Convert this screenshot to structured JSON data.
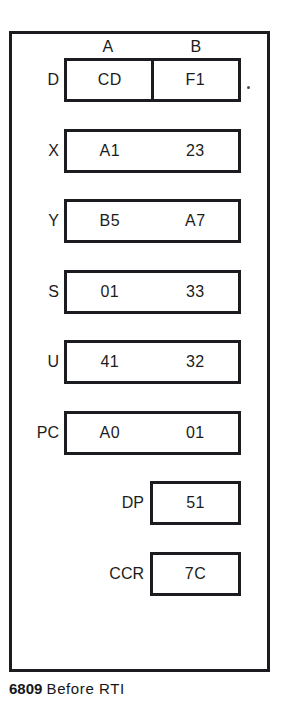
{
  "figure": {
    "column_headers": [
      "A",
      "B"
    ],
    "caption": {
      "code": "6809",
      "text": "Before RTI"
    },
    "registers": [
      {
        "label": "D",
        "width": "wide",
        "split": true,
        "values": [
          "CD",
          "F1"
        ]
      },
      {
        "label": "X",
        "width": "wide",
        "split": false,
        "values": [
          "A1",
          "23"
        ]
      },
      {
        "label": "Y",
        "width": "wide",
        "split": false,
        "values": [
          "B5",
          "A7"
        ]
      },
      {
        "label": "S",
        "width": "wide",
        "split": false,
        "values": [
          "01",
          "33"
        ]
      },
      {
        "label": "U",
        "width": "wide",
        "split": false,
        "values": [
          "41",
          "32"
        ]
      },
      {
        "label": "PC",
        "width": "wide",
        "split": false,
        "values": [
          "A0",
          "01"
        ]
      },
      {
        "label": "DP",
        "width": "narrow",
        "split": false,
        "values": [
          "51"
        ]
      },
      {
        "label": "CCR",
        "width": "narrow",
        "split": false,
        "values": [
          "7C"
        ]
      }
    ]
  },
  "colors": {
    "ink": "#1b1c20",
    "paper": "#ffffff"
  }
}
